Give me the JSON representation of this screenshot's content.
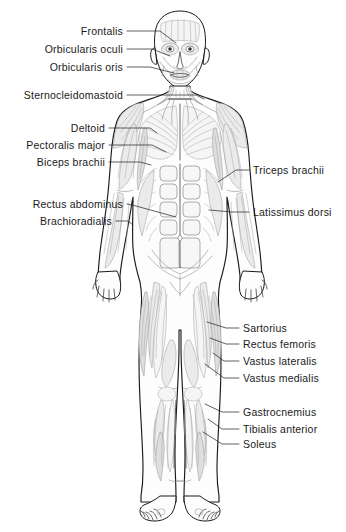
{
  "diagram": {
    "view": "anterior",
    "colors": {
      "outline": "#1a1a1a",
      "muscle_line": "#9a9a9a",
      "muscle_fill_light": "#f4f4f4",
      "muscle_fill_mid": "#e6e6e6",
      "muscle_fill_dark": "#d9d9d9",
      "skin_fill": "#fdfdfd",
      "leader_line": "#2b2b2b",
      "label_text": "#1a1a1a",
      "background": "#ffffff"
    }
  },
  "labels": {
    "left": [
      {
        "id": "frontalis",
        "text": "Frontalis",
        "text_x": 123,
        "text_y": 31,
        "leader": [
          [
            127,
            31
          ],
          [
            160,
            31
          ],
          [
            176,
            43
          ]
        ]
      },
      {
        "id": "orbicularis-oculi",
        "text": "Orbicularis oculi",
        "text_x": 123,
        "text_y": 49,
        "leader": [
          [
            127,
            49
          ],
          [
            152,
            49
          ],
          [
            170,
            56
          ]
        ]
      },
      {
        "id": "orbicularis-oris",
        "text": "Orbicularis oris",
        "text_x": 123,
        "text_y": 67,
        "leader": [
          [
            127,
            67
          ],
          [
            150,
            67
          ],
          [
            174,
            73
          ]
        ]
      },
      {
        "id": "sternocleidomastoid",
        "text": "Sternocleidomastoid",
        "text_x": 123,
        "text_y": 95,
        "leader": [
          [
            127,
            95
          ],
          [
            196,
            95
          ],
          [
            204,
            99
          ]
        ]
      },
      {
        "id": "deltoid",
        "text": "Deltoid",
        "text_x": 105,
        "text_y": 128,
        "leader": [
          [
            109,
            128
          ],
          [
            150,
            128
          ],
          [
            157,
            133
          ]
        ]
      },
      {
        "id": "pectoralis-major",
        "text": "Pectoralis major",
        "text_x": 105,
        "text_y": 145,
        "leader": [
          [
            109,
            145
          ],
          [
            152,
            145
          ],
          [
            166,
            152
          ]
        ]
      },
      {
        "id": "biceps-brachii",
        "text": "Biceps brachii",
        "text_x": 105,
        "text_y": 162,
        "leader": [
          [
            109,
            162
          ],
          [
            140,
            162
          ],
          [
            151,
            165
          ]
        ]
      },
      {
        "id": "rectus-abdominus",
        "text": "Rectus abdominus",
        "text_x": 123,
        "text_y": 204,
        "leader": [
          [
            127,
            204
          ],
          [
            136,
            206
          ],
          [
            176,
            217
          ]
        ]
      },
      {
        "id": "brachioradialis",
        "text": "Brachioradialis",
        "text_x": 112,
        "text_y": 221,
        "leader": [
          [
            116,
            221
          ],
          [
            128,
            221
          ],
          [
            133,
            225
          ]
        ]
      }
    ],
    "right": [
      {
        "id": "triceps-brachii",
        "text": "Triceps brachii",
        "text_x": 253,
        "text_y": 170,
        "leader": [
          [
            249,
            170
          ],
          [
            236,
            170
          ],
          [
            218,
            182
          ]
        ]
      },
      {
        "id": "latissimus-dorsi",
        "text": "Latissimus dorsi",
        "text_x": 253,
        "text_y": 212,
        "leader": [
          [
            249,
            212
          ],
          [
            232,
            212
          ],
          [
            209,
            210
          ]
        ]
      },
      {
        "id": "sartorius",
        "text": "Sartorius",
        "text_x": 243,
        "text_y": 328,
        "leader": [
          [
            239,
            328
          ],
          [
            226,
            328
          ],
          [
            207,
            322
          ]
        ]
      },
      {
        "id": "rectus-femoris",
        "text": "Rectus femoris",
        "text_x": 243,
        "text_y": 344,
        "leader": [
          [
            239,
            344
          ],
          [
            226,
            344
          ],
          [
            210,
            338
          ]
        ]
      },
      {
        "id": "vastus-lateralis",
        "text": "Vastus lateralis",
        "text_x": 243,
        "text_y": 361,
        "leader": [
          [
            239,
            361
          ],
          [
            224,
            361
          ],
          [
            213,
            353
          ]
        ]
      },
      {
        "id": "vastus-medialis",
        "text": "Vastus medialis",
        "text_x": 243,
        "text_y": 378,
        "leader": [
          [
            239,
            378
          ],
          [
            224,
            378
          ],
          [
            205,
            364
          ]
        ]
      },
      {
        "id": "gastrocnemius",
        "text": "Gastrocnemius",
        "text_x": 243,
        "text_y": 412,
        "leader": [
          [
            239,
            412
          ],
          [
            222,
            412
          ],
          [
            205,
            404
          ]
        ]
      },
      {
        "id": "tibialis-anterior",
        "text": "Tibialis anterior",
        "text_x": 243,
        "text_y": 429,
        "leader": [
          [
            239,
            429
          ],
          [
            222,
            429
          ],
          [
            208,
            419
          ]
        ]
      },
      {
        "id": "soleus",
        "text": "Soleus",
        "text_x": 243,
        "text_y": 444,
        "leader": [
          [
            239,
            444
          ],
          [
            222,
            444
          ],
          [
            203,
            432
          ]
        ]
      }
    ]
  }
}
